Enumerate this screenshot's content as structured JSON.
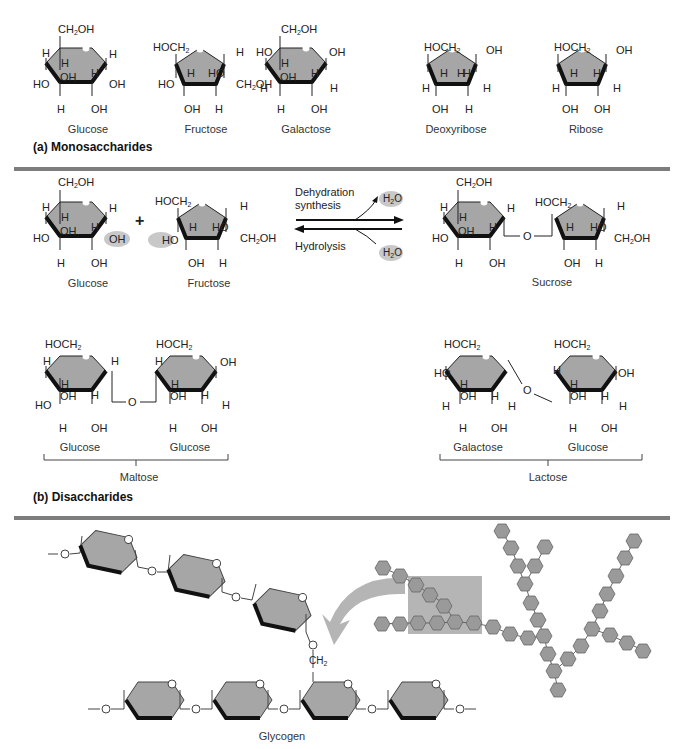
{
  "colors": {
    "ring_fill": "#a6a6a6",
    "ring_edge": "#111111",
    "separator": "#7d7d7d",
    "highlight": "#c8c8c8"
  },
  "monosaccharides": {
    "section_label": "(a) Monosaccharides",
    "items": [
      {
        "name": "Glucose",
        "ring": "hexagon"
      },
      {
        "name": "Fructose",
        "ring": "pentagon"
      },
      {
        "name": "Galactose",
        "ring": "hexagon"
      },
      {
        "name": "Deoxyribose",
        "ring": "pentagon"
      },
      {
        "name": "Ribose",
        "ring": "pentagon"
      }
    ]
  },
  "disaccharides": {
    "section_label": "(b) Disaccharides",
    "reaction": {
      "reactant1": "Glucose",
      "plus": "+",
      "reactant2": "Fructose",
      "forward_label_line1": "Dehydration",
      "forward_label_line2": "synthesis",
      "reverse_label": "Hydrolysis",
      "water": "H2O",
      "product": "Sucrose"
    },
    "maltose": {
      "units": [
        "Glucose",
        "Glucose"
      ],
      "name": "Maltose"
    },
    "lactose": {
      "units": [
        "Galactose",
        "Glucose"
      ],
      "name": "Lactose"
    }
  },
  "polysaccharides": {
    "name": "Glycogen",
    "branch_label": "CH2"
  },
  "atoms": {
    "ch2oh": "CH2OH",
    "hoch2": "HOCH2",
    "oh": "OH",
    "ho": "HO",
    "h": "H",
    "o": "O"
  }
}
